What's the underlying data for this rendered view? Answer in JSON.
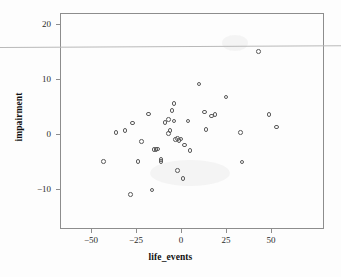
{
  "chart_data": {
    "type": "scatter",
    "title": "",
    "xlabel": "life_events",
    "ylabel": "impairment",
    "xlim": [
      -65,
      65
    ],
    "ylim": [
      -15,
      22
    ],
    "xticks": [
      -50,
      -25,
      0,
      25,
      50
    ],
    "xtick_labels": [
      "−50",
      "−25",
      "0",
      "25",
      "50"
    ],
    "yticks": [
      20,
      10,
      0,
      -10
    ],
    "ytick_labels": [
      "20",
      "10",
      "0",
      "−10"
    ],
    "grid": false,
    "legend": null,
    "marker": "open-circle",
    "marker_color": "#5a5a5a",
    "frame_color": "#8d8d8d",
    "background": "#fdfdfd",
    "n_points": 49,
    "points": [
      {
        "x": -43,
        "y": -5.0
      },
      {
        "x": -36,
        "y": 0.3
      },
      {
        "x": -31,
        "y": 0.6
      },
      {
        "x": -28,
        "y": -11.0
      },
      {
        "x": -27,
        "y": 2.0
      },
      {
        "x": -24,
        "y": -5.0
      },
      {
        "x": -22,
        "y": -1.4
      },
      {
        "x": -18,
        "y": 3.6
      },
      {
        "x": -16,
        "y": -10.2
      },
      {
        "x": -15,
        "y": -2.8
      },
      {
        "x": -14,
        "y": -2.8
      },
      {
        "x": -13,
        "y": -2.7
      },
      {
        "x": -11,
        "y": -5.0
      },
      {
        "x": -11,
        "y": -4.6
      },
      {
        "x": -9,
        "y": 2.1
      },
      {
        "x": -7,
        "y": 2.6
      },
      {
        "x": -7,
        "y": 0.1
      },
      {
        "x": -6,
        "y": 0.6
      },
      {
        "x": -5,
        "y": 4.3
      },
      {
        "x": -4,
        "y": 5.5
      },
      {
        "x": -4,
        "y": 2.4
      },
      {
        "x": -3,
        "y": -1.0
      },
      {
        "x": -2,
        "y": -0.8
      },
      {
        "x": -2,
        "y": -6.6
      },
      {
        "x": -1,
        "y": -1.2
      },
      {
        "x": 0,
        "y": -0.9
      },
      {
        "x": 1,
        "y": -8.1
      },
      {
        "x": 2,
        "y": -2.0
      },
      {
        "x": 4,
        "y": 2.4
      },
      {
        "x": 5,
        "y": -3.0
      },
      {
        "x": 10,
        "y": 9.1
      },
      {
        "x": 13,
        "y": 4.0
      },
      {
        "x": 14,
        "y": 0.8
      },
      {
        "x": 17,
        "y": 3.3
      },
      {
        "x": 19,
        "y": 3.5
      },
      {
        "x": 25,
        "y": 6.7
      },
      {
        "x": 33,
        "y": 0.3
      },
      {
        "x": 34,
        "y": -5.1
      },
      {
        "x": 43,
        "y": 15.0
      },
      {
        "x": 49,
        "y": 3.5
      },
      {
        "x": 53,
        "y": 1.3
      }
    ]
  },
  "artifact": {
    "name": "scan-line",
    "description": "faint horizontal scan line across full image width"
  }
}
